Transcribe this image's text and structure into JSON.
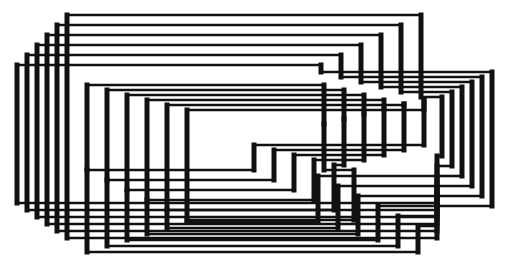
{
  "artwork": {
    "title": "",
    "background": "#ffffff",
    "ink": "#111111",
    "thick_stroke": 5,
    "thin_stroke": 2.6
  },
  "family_outer": [
    {
      "pts": [
        [
          421,
          97
        ],
        [
          421,
          15
        ],
        [
          67,
          15
        ],
        [
          67,
          238
        ],
        [
          437,
          238
        ],
        [
          437,
          206
        ],
        [
          492,
          206
        ]
      ]
    },
    {
      "pts": [
        [
          401,
          92
        ],
        [
          401,
          25
        ],
        [
          57,
          25
        ],
        [
          57,
          231
        ],
        [
          437,
          231
        ],
        [
          437,
          196
        ],
        [
          482,
          196
        ]
      ]
    },
    {
      "pts": [
        [
          381,
          87
        ],
        [
          381,
          35
        ],
        [
          47,
          35
        ],
        [
          47,
          224
        ],
        [
          437,
          224
        ],
        [
          437,
          186
        ],
        [
          472,
          186
        ]
      ]
    },
    {
      "pts": [
        [
          361,
          82
        ],
        [
          361,
          45
        ],
        [
          37,
          45
        ],
        [
          37,
          217
        ],
        [
          437,
          217
        ],
        [
          437,
          176
        ],
        [
          462,
          176
        ]
      ]
    },
    {
      "pts": [
        [
          341,
          77
        ],
        [
          341,
          55
        ],
        [
          27,
          55
        ],
        [
          27,
          210
        ],
        [
          437,
          210
        ],
        [
          437,
          166
        ],
        [
          452,
          166
        ]
      ]
    },
    {
      "pts": [
        [
          321,
          72
        ],
        [
          321,
          65
        ],
        [
          17,
          65
        ],
        [
          17,
          203
        ],
        [
          437,
          203
        ],
        [
          437,
          156
        ],
        [
          442,
          156
        ]
      ]
    }
  ],
  "family_outer_right": [
    {
      "pts": [
        [
          321,
          72
        ],
        [
          492,
          72
        ],
        [
          492,
          206
        ]
      ]
    },
    {
      "pts": [
        [
          341,
          77
        ],
        [
          482,
          77
        ],
        [
          482,
          196
        ]
      ]
    },
    {
      "pts": [
        [
          361,
          82
        ],
        [
          472,
          82
        ],
        [
          472,
          186
        ]
      ]
    },
    {
      "pts": [
        [
          381,
          87
        ],
        [
          462,
          87
        ],
        [
          462,
          176
        ]
      ]
    },
    {
      "pts": [
        [
          401,
          92
        ],
        [
          452,
          92
        ],
        [
          452,
          166
        ]
      ]
    },
    {
      "pts": [
        [
          421,
          97
        ],
        [
          442,
          97
        ],
        [
          442,
          156
        ]
      ]
    }
  ],
  "family_inner": [
    {
      "pts": [
        [
          87,
          85
        ],
        [
          87,
          170
        ],
        [
          254,
          170
        ],
        [
          254,
          145
        ],
        [
          424,
          145
        ],
        [
          424,
          99
        ]
      ]
    },
    {
      "pts": [
        [
          107,
          90
        ],
        [
          107,
          180
        ],
        [
          274,
          180
        ],
        [
          274,
          150
        ],
        [
          404,
          150
        ],
        [
          404,
          104
        ]
      ]
    },
    {
      "pts": [
        [
          127,
          95
        ],
        [
          127,
          190
        ],
        [
          294,
          190
        ],
        [
          294,
          155
        ],
        [
          384,
          155
        ],
        [
          384,
          109
        ]
      ]
    },
    {
      "pts": [
        [
          147,
          100
        ],
        [
          147,
          200
        ],
        [
          314,
          200
        ],
        [
          314,
          160
        ],
        [
          364,
          160
        ],
        [
          364,
          114
        ]
      ]
    },
    {
      "pts": [
        [
          167,
          105
        ],
        [
          167,
          210
        ],
        [
          334,
          210
        ],
        [
          334,
          165
        ],
        [
          344,
          165
        ],
        [
          344,
          119
        ]
      ]
    },
    {
      "pts": [
        [
          187,
          110
        ],
        [
          187,
          220
        ],
        [
          354,
          220
        ],
        [
          354,
          170
        ],
        [
          324,
          170
        ],
        [
          324,
          124
        ]
      ]
    }
  ],
  "family_inner_tops": [
    {
      "pts": [
        [
          87,
          85
        ],
        [
          324,
          85
        ],
        [
          324,
          124
        ]
      ]
    },
    {
      "pts": [
        [
          107,
          90
        ],
        [
          344,
          90
        ],
        [
          344,
          119
        ]
      ]
    },
    {
      "pts": [
        [
          127,
          95
        ],
        [
          364,
          95
        ],
        [
          364,
          114
        ]
      ]
    },
    {
      "pts": [
        [
          147,
          100
        ],
        [
          384,
          100
        ],
        [
          384,
          109
        ]
      ]
    },
    {
      "pts": [
        [
          167,
          105
        ],
        [
          404,
          105
        ],
        [
          404,
          104
        ]
      ]
    },
    {
      "pts": [
        [
          187,
          110
        ],
        [
          424,
          110
        ],
        [
          424,
          99
        ]
      ]
    }
  ],
  "family_bottom": [
    {
      "pts": [
        [
          87,
          170
        ],
        [
          87,
          252
        ],
        [
          418,
          252
        ],
        [
          418,
          226
        ],
        [
          437,
          226
        ]
      ]
    },
    {
      "pts": [
        [
          107,
          180
        ],
        [
          107,
          246
        ],
        [
          398,
          246
        ],
        [
          398,
          216
        ],
        [
          437,
          216
        ]
      ]
    },
    {
      "pts": [
        [
          127,
          190
        ],
        [
          127,
          240
        ],
        [
          378,
          240
        ],
        [
          378,
          206
        ],
        [
          437,
          206
        ]
      ]
    },
    {
      "pts": [
        [
          147,
          200
        ],
        [
          147,
          234
        ],
        [
          358,
          234
        ],
        [
          358,
          196
        ],
        [
          437,
          196
        ]
      ]
    },
    {
      "pts": [
        [
          167,
          210
        ],
        [
          167,
          228
        ],
        [
          338,
          228
        ],
        [
          338,
          186
        ],
        [
          437,
          186
        ]
      ]
    },
    {
      "pts": [
        [
          187,
          220
        ],
        [
          187,
          222
        ],
        [
          318,
          222
        ],
        [
          318,
          176
        ],
        [
          437,
          176
        ]
      ]
    }
  ]
}
